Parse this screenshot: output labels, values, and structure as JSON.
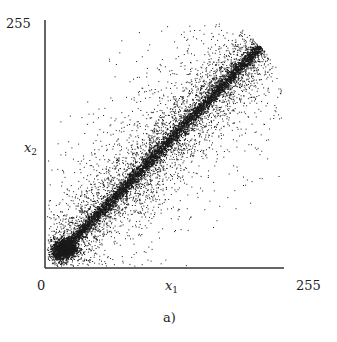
{
  "chart_data": {
    "type": "scatter",
    "title": "",
    "caption": "a)",
    "xlabel": "x1",
    "ylabel": "x2",
    "xlim": [
      0,
      255
    ],
    "ylim": [
      0,
      255
    ],
    "x_ticks": [
      "0",
      "255"
    ],
    "y_ticks": [
      "255"
    ],
    "grid": false,
    "legend": null,
    "series": [
      {
        "name": "points",
        "trend": "x2 ≈ x1",
        "dense_band": {
          "from": [
            10,
            10
          ],
          "to": [
            230,
            230
          ]
        },
        "dense_cluster_center": [
          20,
          20
        ],
        "approx_point_count": 10000
      }
    ]
  },
  "axes": {
    "x_label_main": "x",
    "x_label_sub": "1",
    "y_label_main": "x",
    "y_label_sub": "2",
    "x_min_label": "0",
    "x_max_label": "255",
    "y_max_label": "255"
  },
  "caption": "a)",
  "style": {
    "point_color": "#1a1a1a",
    "axis_color": "#333333"
  }
}
